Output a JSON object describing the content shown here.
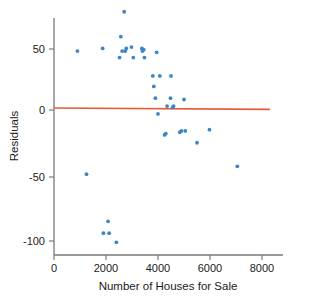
{
  "chart_data": {
    "type": "scatter",
    "title": "",
    "xlabel": "Number of Houses for Sale",
    "ylabel": "Residuals",
    "xlim": [
      -300,
      8500
    ],
    "ylim": [
      -112,
      82
    ],
    "grid": false,
    "legend": null,
    "xticks": [
      0,
      2000,
      4000,
      6000,
      8000
    ],
    "xtick_labels": [
      "0",
      "2000",
      "4000",
      "6000",
      "8000"
    ],
    "yticks": [
      50,
      0,
      -50,
      -100
    ],
    "ytick_labels": [
      "50",
      "0",
      "-50",
      "-100"
    ],
    "point_color": "#3d86c6",
    "line_color": "#e8593a",
    "axis_color": "#7a7a7a",
    "reference_line": {
      "name": "zero-residual-line",
      "x_start": 0,
      "y_start": 1.5,
      "x_end": 8300,
      "y_end": 0.5
    },
    "x": [
      900,
      1250,
      1870,
      1900,
      2080,
      2120,
      2400,
      2520,
      2570,
      2620,
      2700,
      2740,
      2780,
      2980,
      3050,
      3380,
      3400,
      3450,
      3480,
      3800,
      3840,
      3900,
      3950,
      4000,
      4070,
      4250,
      4300,
      4350,
      4480,
      4500,
      4560,
      4600,
      4840,
      4900,
      5000,
      5050,
      5500,
      5980,
      7050
    ],
    "y": [
      45,
      -49,
      47,
      -94,
      -85,
      -94,
      -101,
      40,
      56,
      45,
      75,
      45,
      47,
      48,
      40,
      47,
      45,
      46,
      40,
      26,
      18,
      9,
      44,
      -3,
      26,
      -19,
      -18,
      3,
      9,
      26,
      2,
      3,
      -17,
      -16,
      8,
      -16,
      -25,
      -15,
      -43
    ],
    "n_points": 39
  },
  "axis": {
    "y_label": "Residuals",
    "x_label": "Number of Houses for Sale"
  }
}
